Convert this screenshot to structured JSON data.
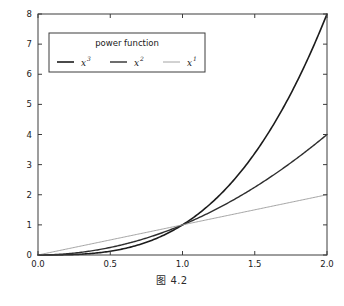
{
  "figure": {
    "caption": "图 4.2",
    "background": "#ffffff"
  },
  "chart_data": {
    "type": "line",
    "title": "",
    "xlabel": "",
    "ylabel": "",
    "xlim": [
      0.0,
      2.0
    ],
    "ylim": [
      0.0,
      8.0
    ],
    "grid": false,
    "xticks": [
      0.0,
      0.5,
      1.0,
      1.5,
      2.0
    ],
    "xticklabels": [
      "0.0",
      "0.5",
      "1.0",
      "1.5",
      "2.0"
    ],
    "yticks": [
      0,
      1,
      2,
      3,
      4,
      5,
      6,
      7,
      8
    ],
    "yticklabels": [
      "0",
      "1",
      "2",
      "3",
      "4",
      "5",
      "6",
      "7",
      "8"
    ],
    "legend": {
      "title": "power function",
      "position": "upper left",
      "ncol": 3
    },
    "series": [
      {
        "name": "x^3",
        "label_base": "x",
        "label_exp": "3",
        "exponent": 3,
        "color": "#1c1c1c",
        "linewidth": 1.6,
        "x": [
          0.0,
          0.1,
          0.2,
          0.3,
          0.4,
          0.5,
          0.6,
          0.7,
          0.8,
          0.9,
          1.0,
          1.1,
          1.2,
          1.3,
          1.4,
          1.5,
          1.6,
          1.7,
          1.8,
          1.9,
          2.0
        ],
        "y": [
          0.0,
          0.001,
          0.008,
          0.027,
          0.064,
          0.125,
          0.216,
          0.343,
          0.512,
          0.729,
          1.0,
          1.331,
          1.728,
          2.197,
          2.744,
          3.375,
          4.096,
          4.913,
          5.832,
          6.859,
          8.0
        ]
      },
      {
        "name": "x^2",
        "label_base": "x",
        "label_exp": "2",
        "exponent": 2,
        "color": "#2e2e2e",
        "linewidth": 1.4,
        "x": [
          0.0,
          0.1,
          0.2,
          0.3,
          0.4,
          0.5,
          0.6,
          0.7,
          0.8,
          0.9,
          1.0,
          1.1,
          1.2,
          1.3,
          1.4,
          1.5,
          1.6,
          1.7,
          1.8,
          1.9,
          2.0
        ],
        "y": [
          0.0,
          0.01,
          0.04,
          0.09,
          0.16,
          0.25,
          0.36,
          0.49,
          0.64,
          0.81,
          1.0,
          1.21,
          1.44,
          1.69,
          1.96,
          2.25,
          2.56,
          2.89,
          3.24,
          3.61,
          4.0
        ]
      },
      {
        "name": "x^1",
        "label_base": "x",
        "label_exp": "1",
        "exponent": 1,
        "color": "#9a9a9a",
        "linewidth": 0.9,
        "x": [
          0.0,
          0.5,
          1.0,
          1.5,
          2.0
        ],
        "y": [
          0.0,
          0.5,
          1.0,
          1.5,
          2.0
        ]
      }
    ]
  },
  "axes": {
    "frame_color": "#3c3c3c",
    "tick_color": "#3c3c3c"
  }
}
